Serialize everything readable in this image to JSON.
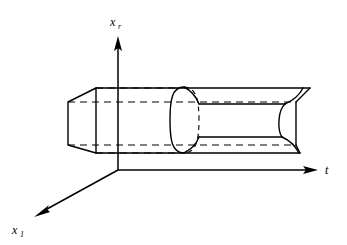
{
  "figure": {
    "background_color": "#ffffff",
    "line_color": "#000000",
    "width": 347,
    "height": 245
  },
  "axes": {
    "origin": {
      "x": 118,
      "y": 170
    },
    "vertical": {
      "name": "x_r",
      "label_text": "x",
      "label_subscript": "r",
      "label_position": {
        "x": 112,
        "y": 24
      },
      "line": {
        "x1": 118,
        "y1": 170,
        "x2": 118,
        "y2": 46
      },
      "arrow_tip": {
        "x": 118,
        "y": 36
      },
      "direction": "up"
    },
    "horizontal": {
      "name": "t",
      "label_text": "t",
      "label_subscript": "",
      "label_position": {
        "x": 327,
        "y": 172
      },
      "line": {
        "x1": 118,
        "y1": 170,
        "x2": 306,
        "y2": 170
      },
      "arrow_tip": {
        "x": 318,
        "y": 170
      },
      "direction": "right"
    },
    "depth": {
      "name": "x_1",
      "label_text": "x",
      "label_subscript": "1",
      "label_position": {
        "x": 14,
        "y": 232
      },
      "line": {
        "x1": 118,
        "y1": 170,
        "x2": 46,
        "y2": 210
      },
      "arrow_tip": {
        "x": 34,
        "y": 217
      },
      "direction": "lower-left"
    }
  },
  "prism": {
    "name": "rectangular-prism",
    "front_face_left": {
      "top_left": {
        "x": 68,
        "y": 102
      },
      "top_right": {
        "x": 96,
        "y": 88
      },
      "bottom_right": {
        "x": 96,
        "y": 153
      },
      "bottom_left": {
        "x": 68,
        "y": 145
      }
    },
    "length_x_end": 310,
    "hidden_edges_dashed": true
  },
  "cylinder": {
    "name": "inscribed-cylinder",
    "left_cap_center": {
      "x": 184,
      "y": 120
    },
    "right_cap_center": {
      "x": 288,
      "y": 120
    },
    "radius_vertical": 33,
    "radius_horizontal": 14,
    "hidden_back_arc_dashed": true
  },
  "labels": {
    "vertical_axis": "x",
    "vertical_axis_sub": "r",
    "horizontal_axis": "t",
    "depth_axis": "x",
    "depth_axis_sub": "1"
  }
}
